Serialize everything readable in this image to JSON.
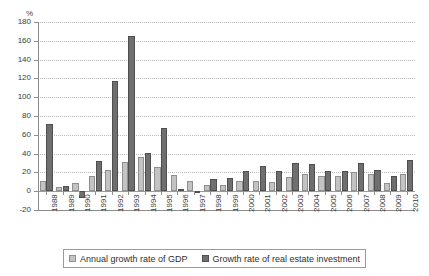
{
  "chart_data": {
    "type": "bar",
    "title": "",
    "xlabel": "",
    "ylabel": "%",
    "ylim": [
      -20,
      180
    ],
    "ytick_step": 20,
    "yticks": [
      180,
      160,
      140,
      120,
      100,
      80,
      60,
      40,
      20,
      0,
      -20
    ],
    "grid": true,
    "grid_axis": "y",
    "grid_style": "dotted",
    "legend_position": "bottom",
    "categories": [
      "1988",
      "1989",
      "1990",
      "1991",
      "1992",
      "1993",
      "1994",
      "1995",
      "1996",
      "1997",
      "1998",
      "1999",
      "2000",
      "2001",
      "2002",
      "2003",
      "2004",
      "2005",
      "2006",
      "2007",
      "2008",
      "2009",
      "2010"
    ],
    "series": [
      {
        "name": "Annual growth rate of GDP",
        "color": "#c3c3c3",
        "values": [
          11,
          4,
          9,
          16,
          23,
          31,
          36,
          26,
          17,
          11,
          7,
          7,
          11,
          11,
          10,
          15,
          18,
          16,
          16,
          20,
          18,
          9,
          18
        ]
      },
      {
        "name": "Growth rate of real estate investment",
        "color": "#6f6f6f",
        "values": [
          71,
          6,
          -7,
          32,
          117,
          165,
          41,
          67,
          2,
          -1,
          13,
          14,
          21,
          27,
          22,
          30,
          29,
          21,
          22,
          30,
          23,
          16,
          33
        ]
      }
    ]
  },
  "axis": {
    "y_unit_label": "%"
  },
  "legend": {
    "items": [
      {
        "label": "Annual growth rate of GDP",
        "swatch": "gdp"
      },
      {
        "label": "Growth rate of real estate investment",
        "swatch": "rei"
      }
    ]
  }
}
